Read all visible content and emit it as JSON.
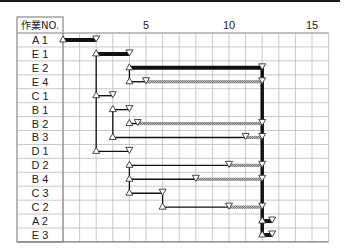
{
  "chart_data": {
    "type": "gantt",
    "title": "",
    "header_label": "作業NO.",
    "x_ticks": [
      5,
      10,
      15
    ],
    "x_range": [
      0,
      16
    ],
    "grid": true,
    "rows": [
      "A1",
      "E1",
      "E2",
      "E4",
      "C1",
      "B1",
      "B2",
      "B3",
      "D1",
      "D2",
      "B4",
      "C3",
      "C2",
      "A2",
      "E3"
    ],
    "tasks": [
      {
        "name": "A1",
        "start": 0,
        "end": 2,
        "float_end": null,
        "critical": true
      },
      {
        "name": "E1",
        "start": 2,
        "end": 4,
        "float_end": null,
        "critical": true
      },
      {
        "name": "E2",
        "start": 4,
        "end": 12,
        "float_end": null,
        "critical": true
      },
      {
        "name": "E4",
        "start": 4,
        "end": 5,
        "float_end": 12,
        "critical": false
      },
      {
        "name": "C1",
        "start": 2,
        "end": 3,
        "float_end": null,
        "critical": false
      },
      {
        "name": "B1",
        "start": 3,
        "end": 4,
        "float_end": null,
        "critical": false
      },
      {
        "name": "B2",
        "start": 4,
        "end": 4.5,
        "float_end": 12,
        "critical": false
      },
      {
        "name": "B3",
        "start": 3,
        "end": 11,
        "float_end": 12,
        "critical": false
      },
      {
        "name": "D1",
        "start": 2,
        "end": 4,
        "float_end": null,
        "critical": false
      },
      {
        "name": "D2",
        "start": 4,
        "end": 10,
        "float_end": 12,
        "critical": false
      },
      {
        "name": "B4",
        "start": 4,
        "end": 8,
        "float_end": 12,
        "critical": false
      },
      {
        "name": "C3",
        "start": 4,
        "end": 6,
        "float_end": null,
        "critical": false
      },
      {
        "name": "C2",
        "start": 6,
        "end": 10,
        "float_end": 12,
        "critical": false
      },
      {
        "name": "A2",
        "start": 12,
        "end": 12.6,
        "float_end": null,
        "critical": true
      },
      {
        "name": "E3",
        "start": 12,
        "end": 12.6,
        "float_end": null,
        "critical": true
      }
    ],
    "connectors": [
      {
        "x": 2,
        "from": "E1",
        "to": "D1"
      },
      {
        "x": 4,
        "from": "E2",
        "to": "E4"
      },
      {
        "x": 3,
        "from": "B1",
        "to": "B3"
      },
      {
        "x": 4,
        "from": "B2",
        "to": "B2"
      },
      {
        "x": 4,
        "from": "D2",
        "to": "C3"
      },
      {
        "x": 6,
        "from": "C3",
        "to": "C2"
      },
      {
        "x": 12,
        "from": "E2",
        "to": "E3",
        "critical": true
      }
    ]
  }
}
